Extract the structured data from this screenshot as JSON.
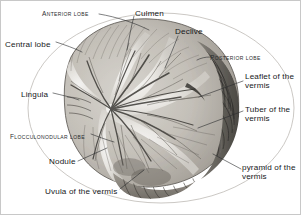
{
  "figure": {
    "style": "grayscale anatomical engraving",
    "width": 301,
    "height": 215,
    "background_color": "#ffffff",
    "border_color": "#c8c8c8",
    "ink_color": "#16181a"
  },
  "labels": [
    {
      "id": "anterior-lobe",
      "text": "Anterior lobe",
      "style": "small-caps",
      "x": 41,
      "y": 8,
      "align": "left"
    },
    {
      "id": "central-lobe",
      "text": "Central lobe",
      "style": "normal",
      "x": 4,
      "y": 39,
      "align": "left"
    },
    {
      "id": "lingula",
      "text": "Lingula",
      "style": "normal",
      "x": 20,
      "y": 89,
      "align": "left"
    },
    {
      "id": "flocculonodular-lobe",
      "text": "Flocculonodular lobe",
      "style": "small-caps",
      "x": 9,
      "y": 131,
      "align": "left"
    },
    {
      "id": "nodule",
      "text": "Nodule",
      "style": "normal",
      "x": 48,
      "y": 160,
      "align": "left"
    },
    {
      "id": "uvula-of-the-vermis",
      "text": "Uvula of the vermis",
      "style": "normal",
      "x": 44,
      "y": 190,
      "align": "left"
    },
    {
      "id": "culmen",
      "text": "Culmen",
      "style": "normal",
      "x": 134,
      "y": 8,
      "align": "left"
    },
    {
      "id": "declive",
      "text": "Declive",
      "style": "normal",
      "x": 174,
      "y": 28,
      "align": "left"
    },
    {
      "id": "posterior-lobe",
      "text": "Posterior lobe",
      "style": "small-caps",
      "x": 209,
      "y": 53,
      "align": "left"
    },
    {
      "id": "leaflet-of-the-vermis",
      "text": "Leaflet of the\nvermis",
      "style": "normal",
      "x": 244,
      "y": 71,
      "align": "left"
    },
    {
      "id": "tuber-of-the-vermis",
      "text": "Tuber of the\nvermis",
      "style": "normal",
      "x": 244,
      "y": 104,
      "align": "left"
    },
    {
      "id": "pyramid-of-the-vermis",
      "text": "pyramid of the\nvermis",
      "style": "normal",
      "x": 241,
      "y": 162,
      "align": "left"
    }
  ],
  "leader_lines": [
    {
      "id": "anterior-lobe-leader",
      "from": [
        98,
        13
      ],
      "to": [
        148,
        28
      ]
    },
    {
      "id": "central-lobe-leader",
      "from": [
        55,
        41
      ],
      "to": [
        80,
        50
      ]
    },
    {
      "id": "lingula-leader",
      "from": [
        52,
        92
      ],
      "to": [
        78,
        98
      ]
    },
    {
      "id": "flocculonodular-lobe-leader",
      "from": [
        90,
        133
      ],
      "to": [
        112,
        140
      ]
    },
    {
      "id": "nodule-leader",
      "from": [
        76,
        160
      ],
      "to": [
        105,
        148
      ]
    },
    {
      "id": "uvula-leader",
      "from": [
        118,
        188
      ],
      "to": [
        142,
        170
      ]
    },
    {
      "id": "culmen-leader",
      "from": [
        133,
        14
      ],
      "to": [
        126,
        48
      ]
    },
    {
      "id": "declive-leader",
      "from": [
        176,
        34
      ],
      "to": [
        164,
        66
      ]
    },
    {
      "id": "posterior-lobe-leader",
      "from": [
        208,
        56
      ],
      "to": [
        196,
        60
      ]
    },
    {
      "id": "leaflet-leader",
      "from": [
        242,
        80
      ],
      "to": [
        197,
        96
      ]
    },
    {
      "id": "tuber-leader",
      "from": [
        242,
        110
      ],
      "to": [
        196,
        126
      ]
    },
    {
      "id": "pyramid-leader",
      "from": [
        239,
        168
      ],
      "to": [
        212,
        154
      ]
    }
  ],
  "anatomy_outline": {
    "description": "oval thin outline enclosing the cerebellar section",
    "center": [
      160,
      107
    ],
    "rx": 134,
    "ry": 96
  }
}
